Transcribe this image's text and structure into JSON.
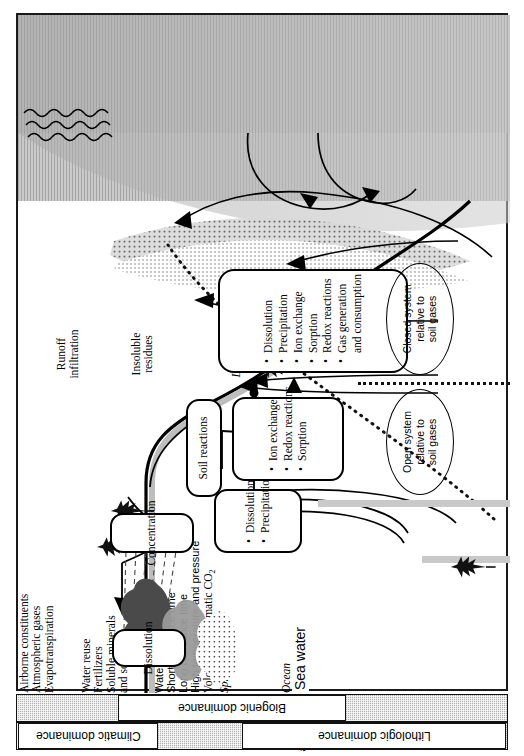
{
  "figure": {
    "orientation": "rotated-90-ccw",
    "frame_border_color": "#1a1a1a"
  },
  "zones": {
    "atmosphere_labels": [
      {
        "id": "airborne-constituents",
        "text": "Airborne constituents"
      },
      {
        "id": "atmospheric-gases",
        "text": "Atmospheric gases"
      }
    ],
    "surface_labels": [
      {
        "id": "evapotranspiration",
        "text": "Evapotranspiration"
      },
      {
        "id": "runoff-infiltration",
        "text": "Runoff\ninfiltration"
      },
      {
        "id": "water-reuse",
        "text": "Water reuse"
      },
      {
        "id": "fertilizers",
        "text": "Fertilizers"
      },
      {
        "id": "soluble-minerals",
        "text": "Soluble minerals\nand soil gases"
      },
      {
        "id": "insoluble-residues",
        "text": "Insoluble\nresidues"
      }
    ],
    "subsurface_labels": [
      {
        "id": "water-table",
        "text": "Water table"
      },
      {
        "id": "short-residence-time",
        "text": "Short residence time"
      },
      {
        "id": "long-residence-time",
        "text": "Long residence time"
      },
      {
        "id": "high-temp-pressure",
        "text": "High temperature and pressure"
      },
      {
        "id": "volcanic-co2",
        "text": "Volcanic or magmatic CO2"
      }
    ],
    "water_body_labels": [
      {
        "id": "springs",
        "text": "Springs"
      },
      {
        "id": "lakes-and-rivers",
        "text": "Lakes and\nRivers"
      },
      {
        "id": "brackish-seeps",
        "text": "Brackish\nseeps"
      },
      {
        "id": "ocean",
        "text": "Ocean"
      },
      {
        "id": "sea-water",
        "text": "Sea water"
      },
      {
        "id": "mixing-zone",
        "text": "Mixing zone"
      }
    ]
  },
  "process_boxes": [
    {
      "id": "dissolution-atmosphere",
      "title": "Dissolution",
      "items": []
    },
    {
      "id": "concentration",
      "title": "Concentration",
      "items": []
    },
    {
      "id": "soil-reactions",
      "title": "Soil reactions",
      "items": []
    },
    {
      "id": "dissolution-precipitation",
      "title": "",
      "items": [
        "Dissolution",
        "Precipitation"
      ]
    },
    {
      "id": "ion-exchange-redox-sorption",
      "title": "",
      "items": [
        "Ion exchange",
        "Redox reactions",
        "Sorption"
      ]
    },
    {
      "id": "deep-reactions",
      "title": "",
      "items": [
        "Dissolution",
        "Precipitation",
        "Ion exchange",
        "Sorption",
        "Redox reactions",
        "Gas generation\nand consumption"
      ]
    }
  ],
  "system_ellipses": [
    {
      "id": "open-system",
      "text": "Open system\nrelative to\nsoil gases"
    },
    {
      "id": "closed-system",
      "text": "Closed system\nrelative to\nsoil gases"
    }
  ],
  "dominance_bars": [
    {
      "id": "biogenic-dominance",
      "label": "Biogenic dominance"
    },
    {
      "id": "climatic-dominance",
      "label": "Climatic dominance"
    },
    {
      "id": "lithologic-dominance",
      "label": "Lithologic dominance"
    }
  ],
  "colors": {
    "ink": "#000000",
    "sea_fill": "#b9b9b9",
    "bar_fill": "#b0b0b0",
    "cloud_dark": "#4a4a4a",
    "cloud_light": "#9a9a9a"
  }
}
